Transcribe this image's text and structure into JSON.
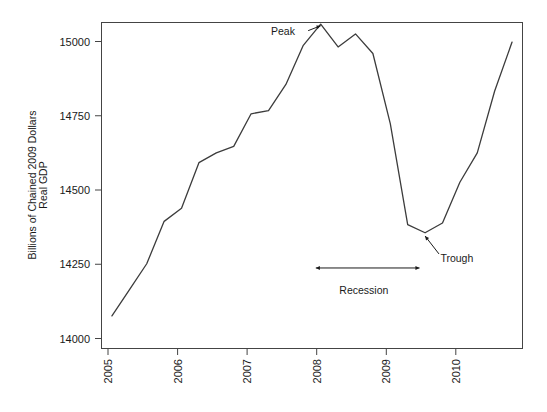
{
  "chart_data": {
    "type": "line",
    "title": "",
    "xlabel": "",
    "ylabel": "Real GDP",
    "ylabel_line2": "Billions of Chained 2009 Dollars",
    "ylim": [
      14000,
      15000
    ],
    "xlim": [
      2004.85,
      2010.9
    ],
    "yticks": [
      14000,
      14250,
      14500,
      14750,
      15000
    ],
    "ytick_labels": [
      "14000",
      "14250",
      "14500",
      "14750",
      "15000"
    ],
    "xticks": [
      2005,
      2006,
      2007,
      2008,
      2009,
      2010
    ],
    "xtick_labels": [
      "2005",
      "2006",
      "2007",
      "2008",
      "2009",
      "2010"
    ],
    "grid": false,
    "legend": "none",
    "line_color": "#3c3c3c",
    "series": [
      {
        "name": "Real GDP",
        "x": [
          2005.0,
          2005.25,
          2005.5,
          2005.75,
          2006.0,
          2006.25,
          2006.5,
          2006.75,
          2007.0,
          2007.25,
          2007.5,
          2007.75,
          2008.0,
          2008.25,
          2008.5,
          2008.75,
          2009.0,
          2009.25,
          2009.5,
          2009.75,
          2010.0,
          2010.25,
          2010.5,
          2010.75
        ],
        "y": [
          14100,
          14180,
          14260,
          14390,
          14430,
          14570,
          14600,
          14620,
          14720,
          14730,
          14810,
          14930,
          14995,
          14925,
          14965,
          14905,
          14690,
          14380,
          14355,
          14385,
          14510,
          14600,
          14790,
          14940
        ]
      }
    ],
    "annotations": [
      {
        "name": "peak",
        "label": "Peak",
        "label_x": 2007.63,
        "label_y": 14975,
        "arrow_from_x": 2007.82,
        "arrow_from_y": 14975,
        "arrow_to_x": 2008.0,
        "arrow_to_y": 14990
      },
      {
        "name": "trough",
        "label": "Trough",
        "label_x": 2009.72,
        "label_y": 14278,
        "arrow_from_x": 2009.7,
        "arrow_from_y": 14290,
        "arrow_to_x": 2009.5,
        "arrow_to_y": 14345
      },
      {
        "name": "recession-span",
        "label": "Recession",
        "label_x": 2008.62,
        "label_y": 14180,
        "span_start_x": 2007.93,
        "span_end_x": 2009.42,
        "span_y": 14247
      }
    ]
  }
}
